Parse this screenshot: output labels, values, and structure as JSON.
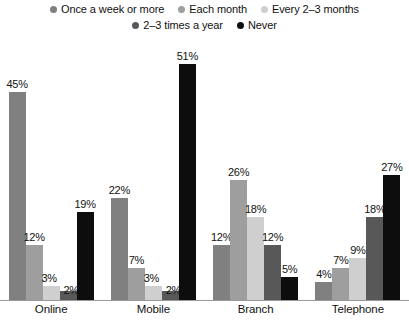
{
  "chart_data": {
    "type": "bar",
    "title": "",
    "subtitle": "",
    "xlabel": "",
    "ylabel": "",
    "ylim": [
      0,
      55
    ],
    "grid": false,
    "legend_position": "top",
    "categories": [
      "Online",
      "Mobile",
      "Branch",
      "Telephone"
    ],
    "series": [
      {
        "name": "Once a week or more",
        "color": "#808080",
        "values": [
          45,
          22,
          12,
          4
        ],
        "labels": [
          "45%",
          "22%",
          "12%",
          "4%"
        ]
      },
      {
        "name": "Each month",
        "color": "#9e9e9e",
        "values": [
          12,
          7,
          26,
          7
        ],
        "labels": [
          "12%",
          "7%",
          "26%",
          "7%"
        ]
      },
      {
        "name": "Every 2–3 months",
        "color": "#cfcfcf",
        "values": [
          3,
          3,
          18,
          9
        ],
        "labels": [
          "3%",
          "3%",
          "18%",
          "9%"
        ]
      },
      {
        "name": "2–3 times a year",
        "color": "#585858",
        "values": [
          2,
          2,
          12,
          18
        ],
        "labels": [
          "2%",
          "2%",
          "12%",
          "18%"
        ]
      },
      {
        "name": "Never",
        "color": "#0d0d0d",
        "values": [
          19,
          51,
          5,
          27
        ],
        "labels": [
          "19%",
          "51%",
          "5%",
          "27%"
        ]
      }
    ]
  },
  "legend": {
    "row1": [
      {
        "label": "Once a week or more",
        "swatch": "legend-swatch-once-a-week-or-more",
        "color": "#808080"
      },
      {
        "label": "Each month",
        "swatch": "legend-swatch-each-month",
        "color": "#9e9e9e"
      },
      {
        "label": "Every 2–3 months",
        "swatch": "legend-swatch-every-2-3-months",
        "color": "#cfcfcf"
      }
    ],
    "row2": [
      {
        "label": "2–3 times a year",
        "swatch": "legend-swatch-2-3-times-a-year",
        "color": "#585858"
      },
      {
        "label": "Never",
        "swatch": "legend-swatch-never",
        "color": "#0d0d0d"
      }
    ]
  },
  "axis": {
    "categories": [
      "Online",
      "Mobile",
      "Branch",
      "Telephone"
    ]
  },
  "style": {
    "background": "#ffffff",
    "baseline_color": "#9a9a9a",
    "text_color": "#111111"
  }
}
